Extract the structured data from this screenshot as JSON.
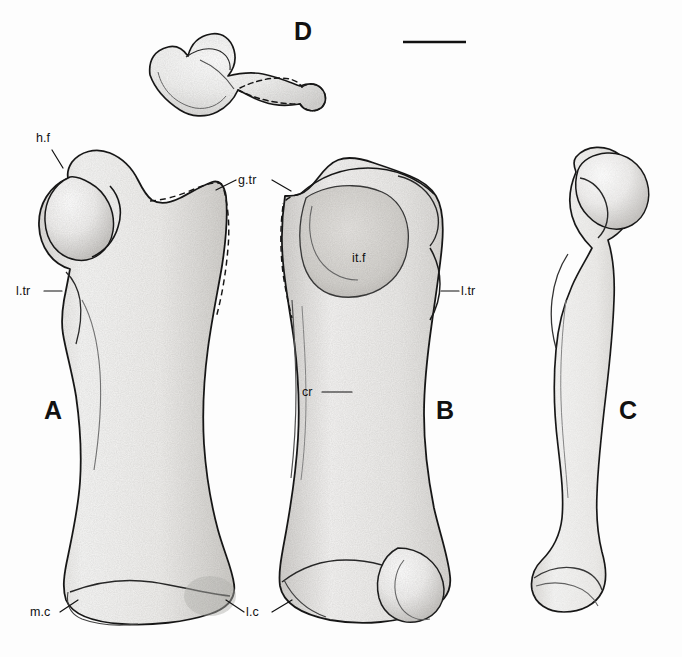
{
  "figure": {
    "type": "scientific-illustration",
    "background_color": "#fdfdfd",
    "ink_color": "#111111"
  },
  "panels": [
    {
      "id": "A",
      "label": "A",
      "x": 53,
      "y": 412,
      "view": "anterior view of left femur"
    },
    {
      "id": "B",
      "label": "B",
      "x": 445,
      "y": 412,
      "view": "posterior view of left femur"
    },
    {
      "id": "C",
      "label": "C",
      "x": 628,
      "y": 412,
      "view": "medial view of femur"
    },
    {
      "id": "D",
      "label": "D",
      "x": 303,
      "y": 32,
      "view": "proximal view of femoral head and trochanters"
    }
  ],
  "annotations": [
    {
      "key": "h.f",
      "label": "h.f",
      "x": 36,
      "y": 138,
      "anchor": "start",
      "meaning": "head of femur"
    },
    {
      "key": "l.tr.A",
      "label": "l.tr",
      "x": 18,
      "y": 287,
      "anchor": "start",
      "meaning": "lesser trochanter"
    },
    {
      "key": "g.tr",
      "label": "g.tr",
      "x": 238,
      "y": 176,
      "anchor": "start",
      "meaning": "greater trochanter"
    },
    {
      "key": "it.f",
      "label": "it.f",
      "x": 352,
      "y": 258,
      "anchor": "start",
      "meaning": "intertrochanteric fossa"
    },
    {
      "key": "l.tr.B",
      "label": "l.tr",
      "x": 461,
      "y": 287,
      "anchor": "start",
      "meaning": "lesser trochanter"
    },
    {
      "key": "cr",
      "label": "cr",
      "x": 302,
      "y": 388,
      "anchor": "start",
      "meaning": "crest"
    },
    {
      "key": "m.c",
      "label": "m.c",
      "x": 34,
      "y": 614,
      "anchor": "start",
      "meaning": "medial condyle"
    },
    {
      "key": "l.c",
      "label": "l.c",
      "x": 246,
      "y": 614,
      "anchor": "start",
      "meaning": "lateral condyle"
    }
  ],
  "scale_bar": {
    "name": "scale-bar",
    "x1": 403,
    "y1": 42,
    "x2": 466,
    "y2": 42,
    "thickness": 2.6,
    "caption": ""
  }
}
